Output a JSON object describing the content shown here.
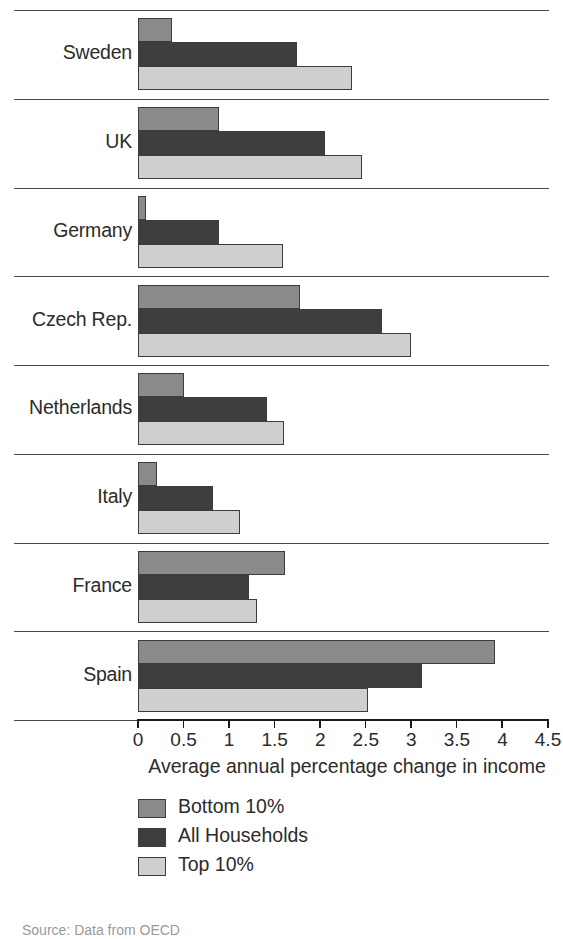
{
  "chart_data": {
    "type": "bar",
    "orientation": "horizontal",
    "title": "",
    "xlabel": "Average annual percentage change in income",
    "ylabel": "",
    "xlim": [
      0,
      4.5
    ],
    "xticks": [
      "0",
      "0.5",
      "1",
      "1.5",
      "2",
      "2.5",
      "3",
      "3.5",
      "4",
      "4.5"
    ],
    "xtick_values": [
      0,
      0.5,
      1,
      1.5,
      2,
      2.5,
      3,
      3.5,
      4,
      4.5
    ],
    "grid": false,
    "legend_position": "below-axis",
    "categories": [
      "Sweden",
      "UK",
      "Germany",
      "Czech Rep.",
      "Netherlands",
      "Italy",
      "France",
      "Spain"
    ],
    "series": [
      {
        "name": "Bottom 10%",
        "color": "#8a8a8a",
        "values": [
          0.37,
          0.89,
          0.09,
          1.78,
          0.5,
          0.21,
          1.61,
          3.92
        ]
      },
      {
        "name": "All Households",
        "color": "#3e3e3e",
        "values": [
          1.75,
          2.05,
          0.89,
          2.68,
          1.42,
          0.82,
          1.22,
          3.12
        ]
      },
      {
        "name": "Top 10%",
        "color": "#cfcfcf",
        "values": [
          2.35,
          2.46,
          1.59,
          3.0,
          1.6,
          1.12,
          1.31,
          2.52
        ]
      }
    ]
  },
  "source_note": "Source: Data from OECD"
}
